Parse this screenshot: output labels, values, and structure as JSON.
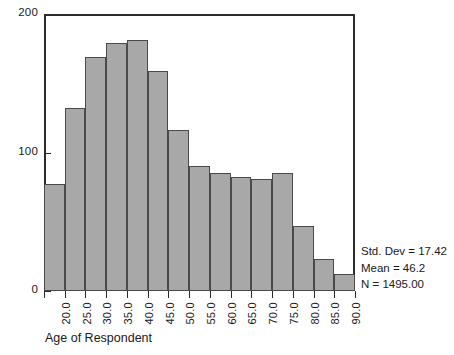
{
  "chart_data": {
    "type": "bar",
    "title": "",
    "subtitle": "",
    "xlabel": "Age of Respondent",
    "ylabel": "",
    "categories": [
      "20.0",
      "25.0",
      "30.0",
      "35.0",
      "40.0",
      "45.0",
      "50.0",
      "55.0",
      "60.0",
      "65.0",
      "70.0",
      "75.0",
      "80.0",
      "85.0",
      "90.0"
    ],
    "bin_edges": [
      17.5,
      22.5,
      27.5,
      32.5,
      37.5,
      42.5,
      47.5,
      52.5,
      57.5,
      62.5,
      67.5,
      72.5,
      77.5,
      82.5,
      87.5,
      92.5
    ],
    "bin_width": 5,
    "values": [
      77,
      132,
      169,
      179,
      181,
      159,
      116,
      90,
      85,
      82,
      81,
      85,
      47,
      23,
      12
    ],
    "xlim": [
      17.5,
      92.5
    ],
    "ylim": [
      0,
      200
    ],
    "ytick_values": [
      0,
      100,
      200
    ],
    "ytick_labels": [
      "0",
      "100",
      "200"
    ],
    "xtick_labels": [
      "20.0",
      "25.0",
      "30.0",
      "35.0",
      "40.0",
      "45.0",
      "50.0",
      "55.0",
      "60.0",
      "65.0",
      "70.0",
      "75.0",
      "80.0",
      "85.0",
      "90.0"
    ],
    "grid": false,
    "legend": null,
    "bar_fill_color": "#a8a8a8",
    "bar_edge_color": "#4a4a4a",
    "axis_color": "#2b2b2b",
    "background_color": "#ffffff",
    "annotations": [
      "Std. Dev = 17.42",
      "Mean = 46.2",
      "N = 1495.00"
    ]
  },
  "stats": {
    "std_dev": "Std. Dev = 17.42",
    "mean": "Mean = 46.2",
    "n": "N = 1495.00"
  },
  "axis": {
    "x_title": "Age of Respondent"
  }
}
